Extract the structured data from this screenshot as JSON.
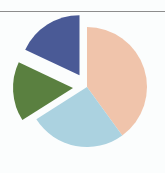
{
  "figure": {
    "background_color": "#fbfdfd",
    "width": 165,
    "height": 173,
    "top_rule_color": "#8d8d8d"
  },
  "chart_data": {
    "type": "pie",
    "title": "",
    "subtitle": "",
    "xlabel": "",
    "ylabel": "",
    "grid": false,
    "legend": false,
    "legend_position": "none",
    "labels": [
      "Segment 1",
      "Segment 2",
      "Segment 3",
      "Segment 4"
    ],
    "values": [
      40,
      26,
      16,
      18
    ],
    "units": "percent",
    "colors": [
      "#f0c4ab",
      "#abd2e0",
      "#5a8040",
      "#4a5a96"
    ],
    "start_angle_deg": 0,
    "direction": "clockwise",
    "exploded": [
      false,
      false,
      true,
      true
    ],
    "explode_offset_px": 14,
    "center_px": [
      87,
      87
    ],
    "radius_px": 60,
    "annotations": []
  }
}
